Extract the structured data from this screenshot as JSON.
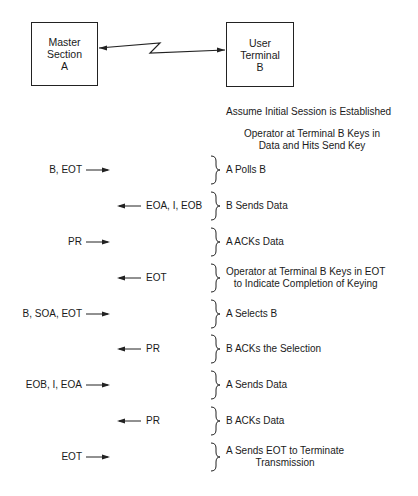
{
  "nodes": {
    "master": {
      "line1": "Master",
      "line2": "Section",
      "line3": "A"
    },
    "terminal": {
      "line1": "User",
      "line2": "Terminal",
      "line3": "B"
    }
  },
  "notes": {
    "assume": "Assume Initial Session is Established",
    "operator_line1": "Operator at Terminal B Keys in",
    "operator_line2": "Data and Hits Send Key"
  },
  "steps": [
    {
      "message": "B, EOT",
      "direction": "right",
      "desc1": "A Polls B",
      "desc2": ""
    },
    {
      "message": "EOA, I, EOB",
      "direction": "left",
      "desc1": "B Sends Data",
      "desc2": ""
    },
    {
      "message": "PR",
      "direction": "right",
      "desc1": "A ACKs Data",
      "desc2": ""
    },
    {
      "message": "EOT",
      "direction": "left",
      "desc1": "Operator at Terminal B Keys in EOT",
      "desc2": "to Indicate Completion of Keying"
    },
    {
      "message": "B, SOA, EOT",
      "direction": "right",
      "desc1": "A Selects B",
      "desc2": ""
    },
    {
      "message": "PR",
      "direction": "left",
      "desc1": "B ACKs the Selection",
      "desc2": ""
    },
    {
      "message": "EOB, I, EOA",
      "direction": "right",
      "desc1": "A Sends Data",
      "desc2": ""
    },
    {
      "message": "PR",
      "direction": "left",
      "desc1": "B ACKs Data",
      "desc2": ""
    },
    {
      "message": "EOT",
      "direction": "right",
      "desc1": "A Sends EOT to Terminate",
      "desc2": "Transmission"
    }
  ]
}
